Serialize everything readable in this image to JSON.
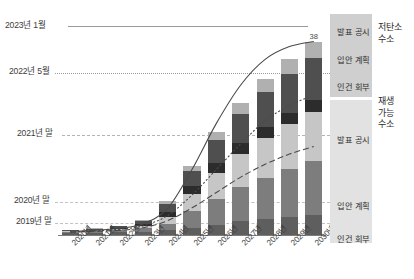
{
  "chart_data": {
    "type": "bar",
    "title": "",
    "xlabel": "",
    "ylabel": "",
    "grid": true,
    "legend_position": "right",
    "categories": [
      "2020년",
      "2021년",
      "2022년",
      "2023년",
      "2024년",
      "2025년",
      "2026년",
      "2027년",
      "2028년",
      "2029년",
      "2030년"
    ],
    "ylim": [
      0,
      42
    ],
    "value_labels": {
      "2030년": "38"
    },
    "series": [
      {
        "name": "재생 가능 수소 - 인건 회부",
        "color": "#5e5e5e",
        "values": [
          0.6,
          0.6,
          0.7,
          0.8,
          1.1,
          1.6,
          2.2,
          2.9,
          3.4,
          3.8,
          4.2
        ]
      },
      {
        "name": "재생 가능 수소 - 입안 계획",
        "color": "#7d7d7d",
        "values": [
          0.2,
          0.3,
          0.4,
          0.7,
          1.3,
          3.2,
          5.0,
          6.6,
          8.0,
          9.2,
          10.4
        ]
      },
      {
        "name": "재생 가능 수소 - 발표 공시",
        "color": "#c6c6c6",
        "values": [
          0.1,
          0.2,
          0.3,
          0.5,
          1.4,
          3.4,
          5.2,
          6.6,
          7.8,
          8.8,
          9.6
        ]
      },
      {
        "name": "저탄소 수소 - 인건 회부",
        "color": "#2c2c2c",
        "values": [
          0.1,
          0.1,
          0.2,
          0.3,
          0.9,
          1.5,
          1.8,
          2.0,
          2.1,
          2.2,
          2.3
        ]
      },
      {
        "name": "저탄소 수소 - 입안 계획",
        "color": "#4f4f4f",
        "values": [
          0.1,
          0.2,
          0.3,
          0.6,
          1.6,
          3.0,
          4.6,
          5.8,
          6.8,
          7.6,
          8.3
        ]
      },
      {
        "name": "저탄소 수소 - 발표 공시",
        "color": "#b0b0b0",
        "values": [
          0.05,
          0.1,
          0.1,
          0.2,
          0.5,
          1.0,
          1.6,
          2.1,
          2.5,
          2.9,
          3.2
        ]
      }
    ],
    "trend_lines": [
      {
        "name": "2023년 1월 추세",
        "style": "solid",
        "points": [
          [
            0,
            0.9
          ],
          [
            1,
            1.1
          ],
          [
            2,
            1.5
          ],
          [
            3,
            2.4
          ],
          [
            4,
            5.4
          ],
          [
            5,
            13.0
          ],
          [
            6,
            22.0
          ],
          [
            7,
            29.5
          ],
          [
            8,
            34.5
          ],
          [
            9,
            37.0
          ],
          [
            10,
            38.0
          ]
        ]
      },
      {
        "name": "2022년 5월 추세",
        "style": "dotted",
        "points": [
          [
            0,
            0.8
          ],
          [
            1,
            1.0
          ],
          [
            2,
            1.3
          ],
          [
            3,
            2.0
          ],
          [
            4,
            4.0
          ],
          [
            5,
            8.0
          ],
          [
            6,
            13.0
          ],
          [
            7,
            18.0
          ],
          [
            8,
            22.5
          ],
          [
            9,
            25.5
          ],
          [
            10,
            27.5
          ]
        ]
      },
      {
        "name": "2021년 말 추세",
        "style": "dashed",
        "points": [
          [
            0,
            0.7
          ],
          [
            1,
            0.9
          ],
          [
            2,
            1.1
          ],
          [
            3,
            1.6
          ],
          [
            4,
            3.0
          ],
          [
            5,
            5.5
          ],
          [
            6,
            8.5
          ],
          [
            7,
            11.5
          ],
          [
            8,
            14.0
          ],
          [
            9,
            16.0
          ],
          [
            10,
            17.5
          ]
        ]
      }
    ],
    "y_reference_lines": [
      {
        "label": "2023년 1월",
        "value": 38.0,
        "style": "solid"
      },
      {
        "label": "2022년 5월",
        "value": 27.4,
        "style": "dotted"
      },
      {
        "label": "2021년 말",
        "value": 16.4,
        "style": "dashed"
      },
      {
        "label": "2020년 말",
        "value": 4.0,
        "style": "dashed"
      },
      {
        "label": "2019년 말",
        "value": 0.9,
        "style": "dashed"
      }
    ]
  },
  "y_labels": [
    {
      "text": "2023년 1월"
    },
    {
      "text": "2022년 5월"
    },
    {
      "text": "2021년 말"
    },
    {
      "text": "2020년 말"
    },
    {
      "text": "2019년 말"
    }
  ],
  "x_labels": [
    {
      "text": "2020년"
    },
    {
      "text": "2021년"
    },
    {
      "text": "2022년"
    },
    {
      "text": "2023년"
    },
    {
      "text": "2024년"
    },
    {
      "text": "2025년"
    },
    {
      "text": "2026년"
    },
    {
      "text": "2027년"
    },
    {
      "text": "2028년"
    },
    {
      "text": "2029년"
    },
    {
      "text": "2030년"
    }
  ],
  "legend": {
    "low_carbon": {
      "side_label": "저탄소\n수소",
      "side_label_lines": [
        "저탄소",
        "수소"
      ],
      "items": [
        {
          "label": "발표 공시",
          "color": "#b0b0b0"
        },
        {
          "label": "입안 계획",
          "color": "#4f4f4f"
        },
        {
          "label": "인건 회부",
          "color": "#2c2c2c"
        }
      ]
    },
    "renewable": {
      "side_label_lines": [
        "재생",
        "가능",
        "수소"
      ],
      "items": [
        {
          "label": "발표 공시",
          "color": "#c6c6c6"
        },
        {
          "label": "입안 계획",
          "color": "#7d7d7d"
        },
        {
          "label": "인건 회부",
          "color": "#5e5e5e"
        }
      ]
    }
  },
  "bar_value_label": "38"
}
